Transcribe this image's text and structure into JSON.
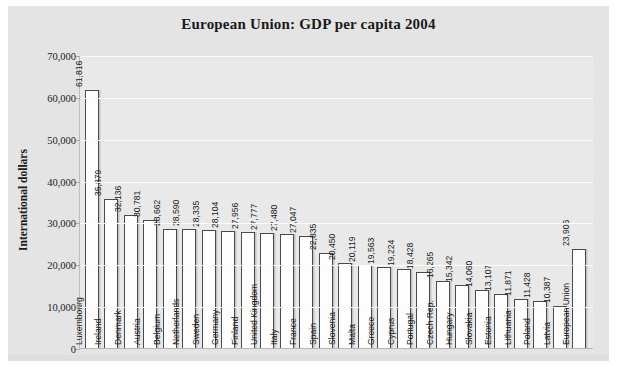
{
  "chart_data": {
    "type": "bar",
    "title": "European Union: GDP per capita 2004",
    "xlabel": "",
    "ylabel": "International dollars",
    "ylim": [
      0,
      70000
    ],
    "yticks": [
      "0",
      "10,000",
      "20,000",
      "30,000",
      "40,000",
      "50,000",
      "60,000",
      "70,000"
    ],
    "ytick_values": [
      0,
      10000,
      20000,
      30000,
      40000,
      50000,
      60000,
      70000
    ],
    "grid": true,
    "legend": "none",
    "orientation": "vertical",
    "categories": [
      "Luxembourg",
      "Ireland",
      "Denmark",
      "Austria",
      "Belgium",
      "Netherlands",
      "Sweden",
      "Germany",
      "Finland",
      "United Kingdom",
      "Italy",
      "France",
      "Spain",
      "Slovenia",
      "Malta",
      "Greece",
      "Cyprus",
      "Portugal",
      "Czech Rep.",
      "Hungary",
      "Slovakia",
      "Estonia",
      "Lithuania",
      "Poland",
      "Latvia",
      "European Union"
    ],
    "values": [
      61816,
      35879,
      32136,
      30781,
      28662,
      28590,
      28335,
      28104,
      27956,
      27777,
      27480,
      27047,
      22835,
      20450,
      20119,
      19563,
      19224,
      18428,
      16265,
      15342,
      14060,
      13107,
      11871,
      11428,
      10387,
      23906
    ],
    "value_labels": [
      "61,816",
      "35,879",
      "32,136",
      "30,781",
      "28,662",
      "28,590",
      "28,335",
      "28,104",
      "27,956",
      "27,777",
      "27,480",
      "27,047",
      "22,835",
      "20,450",
      "20,119",
      "19,563",
      "19,224",
      "18,428",
      "16,265",
      "15,342",
      "14,060",
      "13,107",
      "11,871",
      "11,428",
      "10,387",
      "23,906"
    ],
    "colors": {
      "bar_fill": "#fdfdfd",
      "bar_border": "#4a4a4a",
      "plot_background": "#e9e9e9",
      "frame_background": "#e4e4e4",
      "gridline": "#fcfcfc",
      "text": "#1b1b1b"
    }
  }
}
